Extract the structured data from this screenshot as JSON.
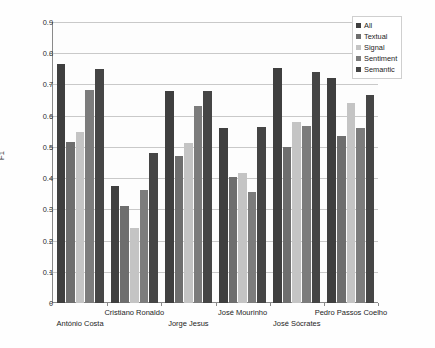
{
  "chart_data": {
    "type": "bar",
    "title": "",
    "xlabel": "",
    "ylabel": "F1",
    "ylim": [
      0,
      0.9
    ],
    "ytick_labels": [
      "0.9",
      "0.8",
      "0.7",
      "0.6",
      "0.5",
      "0.4",
      "0.3",
      "0.2",
      "0.1",
      "0"
    ],
    "ytick_values": [
      0.9,
      0.8,
      0.7,
      0.6,
      0.5,
      0.4,
      0.3,
      0.2,
      0.1,
      0
    ],
    "grid": true,
    "legend_position": "top-right",
    "categories": [
      "António Costa",
      "Cristiano Ronaldo",
      "Jorge Jesus",
      "José Mourinho",
      "José Sócrates",
      "Pedro Passos Coelho"
    ],
    "series": [
      {
        "name": "All",
        "color": "#3f3f3f",
        "values": [
          0.765,
          0.375,
          0.68,
          0.56,
          0.752,
          0.72
        ]
      },
      {
        "name": "Textual",
        "color": "#6e6e6e",
        "values": [
          0.515,
          0.31,
          0.47,
          0.405,
          0.5,
          0.535
        ]
      },
      {
        "name": "Signal",
        "color": "#c4c4c4",
        "values": [
          0.548,
          0.24,
          0.512,
          0.415,
          0.58,
          0.64
        ]
      },
      {
        "name": "Sentiment",
        "color": "#7c7c7c",
        "values": [
          0.683,
          0.363,
          0.632,
          0.355,
          0.568,
          0.562
        ]
      },
      {
        "name": "Semantic",
        "color": "#454545",
        "values": [
          0.748,
          0.48,
          0.68,
          0.565,
          0.74,
          0.665
        ]
      }
    ]
  },
  "legend": {
    "items": [
      {
        "label": "All"
      },
      {
        "label": "Textual"
      },
      {
        "label": "Signal"
      },
      {
        "label": "Sentiment"
      },
      {
        "label": "Semantic"
      }
    ]
  },
  "axes": {
    "y_axis_title": "F1"
  }
}
